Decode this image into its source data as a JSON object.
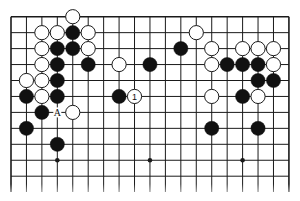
{
  "diagram": {
    "type": "go-board-fragment",
    "board_size": 19,
    "visible_rows": 11,
    "grid": {
      "origin_x": 11,
      "origin_y": 16.7,
      "col_spacing": 15.44,
      "row_spacing": 15.95,
      "bottom_fade_y": 192
    },
    "colors": {
      "line": "#1a1a1a",
      "black_stone": "#111111",
      "white_stone_fill": "#ffffff",
      "white_stone_stroke": "#1a1a1a",
      "background": "#ffffff"
    },
    "star_points": [
      {
        "col": 3,
        "row": 9
      },
      {
        "col": 9,
        "row": 9
      },
      {
        "col": 15,
        "row": 9
      }
    ],
    "stones": [
      {
        "color": "white",
        "col": 4,
        "row": 0
      },
      {
        "color": "white",
        "col": 2,
        "row": 1
      },
      {
        "color": "white",
        "col": 3,
        "row": 1
      },
      {
        "color": "black",
        "col": 4,
        "row": 1
      },
      {
        "color": "white",
        "col": 5,
        "row": 1
      },
      {
        "color": "white",
        "col": 2,
        "row": 2
      },
      {
        "color": "black",
        "col": 3,
        "row": 2
      },
      {
        "color": "black",
        "col": 4,
        "row": 2
      },
      {
        "color": "white",
        "col": 5,
        "row": 2
      },
      {
        "color": "white",
        "col": 2,
        "row": 3
      },
      {
        "color": "black",
        "col": 3,
        "row": 3
      },
      {
        "color": "black",
        "col": 5,
        "row": 3
      },
      {
        "color": "white",
        "col": 1,
        "row": 4
      },
      {
        "color": "white",
        "col": 2,
        "row": 4
      },
      {
        "color": "black",
        "col": 3,
        "row": 4
      },
      {
        "color": "black",
        "col": 1,
        "row": 5
      },
      {
        "color": "white",
        "col": 2,
        "row": 5
      },
      {
        "color": "black",
        "col": 3,
        "row": 5
      },
      {
        "color": "black",
        "col": 2,
        "row": 6
      },
      {
        "color": "white",
        "col": 4,
        "row": 6
      },
      {
        "color": "black",
        "col": 1,
        "row": 7
      },
      {
        "color": "black",
        "col": 3,
        "row": 8
      },
      {
        "color": "white",
        "col": 7,
        "row": 3
      },
      {
        "color": "black",
        "col": 9,
        "row": 3
      },
      {
        "color": "black",
        "col": 11,
        "row": 2
      },
      {
        "color": "black",
        "col": 7,
        "row": 5
      },
      {
        "color": "white",
        "col": 8,
        "row": 5,
        "label": "1"
      },
      {
        "color": "white",
        "col": 12,
        "row": 1
      },
      {
        "color": "white",
        "col": 13,
        "row": 2
      },
      {
        "color": "white",
        "col": 15,
        "row": 2
      },
      {
        "color": "white",
        "col": 16,
        "row": 2
      },
      {
        "color": "white",
        "col": 17,
        "row": 2
      },
      {
        "color": "white",
        "col": 13,
        "row": 3
      },
      {
        "color": "black",
        "col": 14,
        "row": 3
      },
      {
        "color": "black",
        "col": 15,
        "row": 3
      },
      {
        "color": "black",
        "col": 16,
        "row": 3
      },
      {
        "color": "white",
        "col": 17,
        "row": 3
      },
      {
        "color": "black",
        "col": 16,
        "row": 4
      },
      {
        "color": "black",
        "col": 17,
        "row": 4
      },
      {
        "color": "white",
        "col": 13,
        "row": 5
      },
      {
        "color": "black",
        "col": 15,
        "row": 5
      },
      {
        "color": "white",
        "col": 16,
        "row": 5
      },
      {
        "color": "black",
        "col": 13,
        "row": 7
      },
      {
        "color": "black",
        "col": 16,
        "row": 7
      }
    ],
    "point_labels": [
      {
        "text": "A",
        "col": 3,
        "row": 6
      }
    ]
  }
}
